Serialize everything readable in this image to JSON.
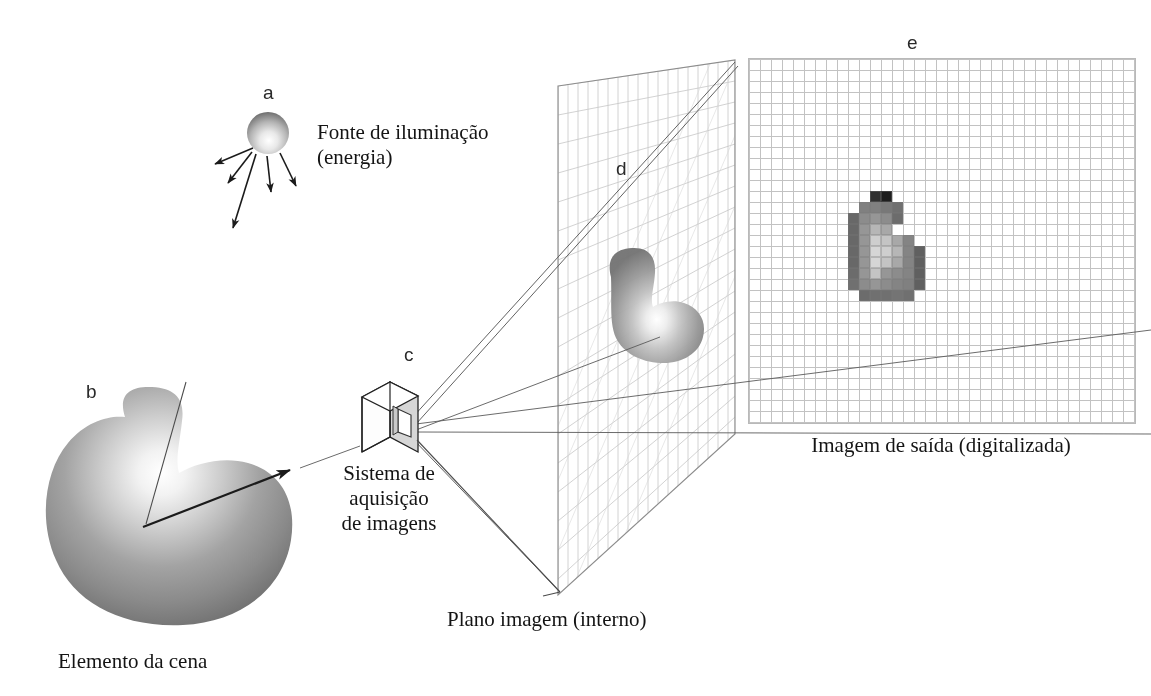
{
  "figure": {
    "title_letters": {
      "a": "a",
      "b": "b",
      "c": "c",
      "d": "d",
      "e": "e"
    },
    "captions": {
      "illumination_line1": "Fonte de iluminação",
      "illumination_line2": "(energia)",
      "scene_element": "Elemento da cena",
      "acquisition_line1": "Sistema de",
      "acquisition_line2": "aquisição",
      "acquisition_line3": "de imagens",
      "image_plane": "Plano imagem (interno)",
      "output_image": "Imagem de saída (digitalizada)"
    },
    "colors": {
      "ink": "#1b1b1b",
      "grid_line": "#b0b0b0",
      "plane_grid": "#c9c9c9",
      "plane_outline": "#6e6e6e",
      "box_face": "#d4d4d4",
      "box_edge": "#262626"
    }
  },
  "digitized_image": {
    "type": "heatmap",
    "grid_cols": 35,
    "grid_rows": 33,
    "cell_px": 11,
    "note": "Gray-level pixel map of the projected scene element",
    "blob_cells": [
      {
        "c": 11,
        "r": 12,
        "v": 48
      },
      {
        "c": 12,
        "r": 12,
        "v": 30
      },
      {
        "c": 10,
        "r": 13,
        "v": 128
      },
      {
        "c": 11,
        "r": 13,
        "v": 128
      },
      {
        "c": 12,
        "r": 13,
        "v": 120
      },
      {
        "c": 13,
        "r": 13,
        "v": 112
      },
      {
        "c": 9,
        "r": 14,
        "v": 104
      },
      {
        "c": 10,
        "r": 14,
        "v": 140
      },
      {
        "c": 11,
        "r": 14,
        "v": 150
      },
      {
        "c": 12,
        "r": 14,
        "v": 140
      },
      {
        "c": 13,
        "r": 14,
        "v": 108
      },
      {
        "c": 9,
        "r": 15,
        "v": 104
      },
      {
        "c": 10,
        "r": 15,
        "v": 150
      },
      {
        "c": 11,
        "r": 15,
        "v": 182
      },
      {
        "c": 12,
        "r": 15,
        "v": 168
      },
      {
        "c": 9,
        "r": 16,
        "v": 104
      },
      {
        "c": 10,
        "r": 16,
        "v": 150
      },
      {
        "c": 11,
        "r": 16,
        "v": 206
      },
      {
        "c": 12,
        "r": 16,
        "v": 196
      },
      {
        "c": 13,
        "r": 16,
        "v": 168
      },
      {
        "c": 14,
        "r": 16,
        "v": 132
      },
      {
        "c": 9,
        "r": 17,
        "v": 104
      },
      {
        "c": 10,
        "r": 17,
        "v": 150
      },
      {
        "c": 11,
        "r": 17,
        "v": 214
      },
      {
        "c": 12,
        "r": 17,
        "v": 206
      },
      {
        "c": 13,
        "r": 17,
        "v": 182
      },
      {
        "c": 14,
        "r": 17,
        "v": 132
      },
      {
        "c": 15,
        "r": 17,
        "v": 96
      },
      {
        "c": 9,
        "r": 18,
        "v": 104
      },
      {
        "c": 10,
        "r": 18,
        "v": 150
      },
      {
        "c": 11,
        "r": 18,
        "v": 214
      },
      {
        "c": 12,
        "r": 18,
        "v": 196
      },
      {
        "c": 13,
        "r": 18,
        "v": 168
      },
      {
        "c": 14,
        "r": 18,
        "v": 132
      },
      {
        "c": 15,
        "r": 18,
        "v": 96
      },
      {
        "c": 9,
        "r": 19,
        "v": 108
      },
      {
        "c": 10,
        "r": 19,
        "v": 150
      },
      {
        "c": 11,
        "r": 19,
        "v": 196
      },
      {
        "c": 12,
        "r": 19,
        "v": 150
      },
      {
        "c": 13,
        "r": 19,
        "v": 140
      },
      {
        "c": 14,
        "r": 19,
        "v": 132
      },
      {
        "c": 15,
        "r": 19,
        "v": 96
      },
      {
        "c": 9,
        "r": 20,
        "v": 112
      },
      {
        "c": 10,
        "r": 20,
        "v": 140
      },
      {
        "c": 11,
        "r": 20,
        "v": 150
      },
      {
        "c": 12,
        "r": 20,
        "v": 140
      },
      {
        "c": 13,
        "r": 20,
        "v": 132
      },
      {
        "c": 14,
        "r": 20,
        "v": 128
      },
      {
        "c": 15,
        "r": 20,
        "v": 96
      },
      {
        "c": 10,
        "r": 21,
        "v": 108
      },
      {
        "c": 11,
        "r": 21,
        "v": 112
      },
      {
        "c": 12,
        "r": 21,
        "v": 112
      },
      {
        "c": 13,
        "r": 21,
        "v": 116
      },
      {
        "c": 14,
        "r": 21,
        "v": 112
      }
    ]
  }
}
